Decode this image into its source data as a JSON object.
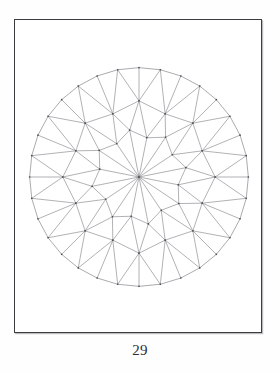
{
  "page": {
    "number_label": "29",
    "background_color": "#ffffff"
  },
  "frame": {
    "name": "figure-border",
    "border_color": "#3b3b40",
    "shadow_color": "#bcbcc0"
  },
  "figure": {
    "line_color": "#6e6e75",
    "vertex_color": "#4a4a50",
    "geometry": {
      "center_x": 127,
      "center_y": 150,
      "girdle_radius": 112,
      "girdle_sides": 32,
      "inner_ring_sides": 16,
      "inner_ring_radius_major": 49,
      "inner_ring_radius_minor": 41,
      "spoke_count": 16,
      "rotation_offset_deg": -90
    }
  }
}
